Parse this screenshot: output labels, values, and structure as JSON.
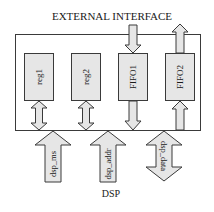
{
  "diagram": {
    "title_top": "EXTERNAL INTERFACE",
    "title_bottom": "DSP",
    "colors": {
      "stroke": "#3a3a3a",
      "fill": "#e6e6e6",
      "text": "#1a1a1a",
      "background": "#ffffff"
    },
    "blocks": [
      {
        "id": "reg1",
        "label": "reg1"
      },
      {
        "id": "reg2",
        "label": "reg2"
      },
      {
        "id": "fifo1",
        "label": "FIFO1"
      },
      {
        "id": "fifo2",
        "label": "FIFO2"
      }
    ],
    "signals": [
      {
        "id": "dsp_ms",
        "label": "dsp_ms",
        "direction": "up"
      },
      {
        "id": "dsp_addr",
        "label": "dsp_addr",
        "direction": "up"
      },
      {
        "id": "dsp_data",
        "label": "dsp_data",
        "direction": "bidirectional"
      }
    ],
    "connections": [
      {
        "from": "reg1",
        "to": "bus",
        "type": "bidirectional"
      },
      {
        "from": "reg2",
        "to": "bus",
        "type": "bidirectional"
      },
      {
        "from": "external-interface",
        "to": "fifo1",
        "type": "down"
      },
      {
        "from": "fifo1",
        "to": "bus",
        "type": "down"
      },
      {
        "from": "fifo2",
        "to": "external-interface",
        "type": "up"
      },
      {
        "from": "bus",
        "to": "fifo2",
        "type": "up"
      }
    ]
  }
}
